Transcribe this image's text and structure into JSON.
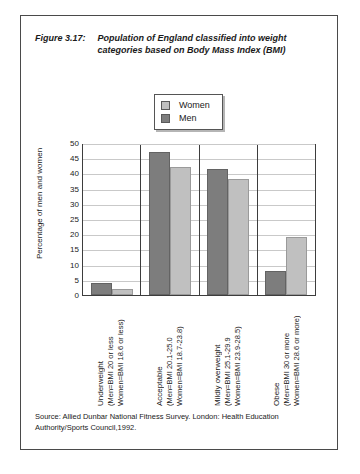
{
  "figure": {
    "number": "Figure 3.17:",
    "title_line1": "Population of England classified into weight",
    "title_line2": "categories based on Body Mass Index (BMI)"
  },
  "legend": {
    "items": [
      {
        "label": "Women",
        "color": "#c0c0c0",
        "swatch_name": "legend-swatch-women"
      },
      {
        "label": "Men",
        "color": "#7d7d7d",
        "swatch_name": "legend-swatch-men"
      }
    ]
  },
  "source": {
    "line1": "Source: Allied Dunbar National Fitness Survey. London: Health Education",
    "line2": "Authority/Sports Council,1992."
  },
  "chart_data": {
    "type": "bar",
    "title": "Population of England classified into weight categories based on Body Mass Index (BMI)",
    "xlabel": "",
    "ylabel": "Percentage of men and women",
    "ylim": [
      0,
      50
    ],
    "yticks": [
      0,
      5,
      10,
      15,
      20,
      25,
      30,
      35,
      40,
      45,
      50
    ],
    "ytick_labels": [
      "0",
      "5",
      "10",
      "15",
      "20",
      "25",
      "30",
      "35",
      "40",
      "45",
      "50"
    ],
    "grid": true,
    "legend_position": "top-center",
    "bar_order": [
      "Men",
      "Women"
    ],
    "categories": [
      "Underweight\n(Men=BMI 20 or less\nWomen=BMI 18.6 or less)",
      "Acceptable\n(Men=BMI 20.1-25.0\nWomen=BMI 18.7-23.8)",
      "Mildly overweight\n(Men=BMI 25.1-29.9\nWomen=BMI 23.9-28.5)",
      "Obese\n(Men=BMI 30 or more\nWomen=BMI 28.6 or more)"
    ],
    "category_details": [
      {
        "name": "Underweight",
        "men_range": "(Men=BMI 20 or less",
        "women_range": "Women=BMI 18.6 or less)"
      },
      {
        "name": "Acceptable",
        "men_range": "(Men=BMI 20.1-25.0",
        "women_range": "Women=BMI 18.7-23.8)"
      },
      {
        "name": "Mildly overweight",
        "men_range": "(Men=BMI 25.1-29.9",
        "women_range": "Women=BMI 23.9-28.5)"
      },
      {
        "name": "Obese",
        "men_range": "(Men=BMI 30 or more",
        "women_range": "Women=BMI 28.6 or more)"
      }
    ],
    "series": [
      {
        "name": "Men",
        "color": "#7d7d7d",
        "values": [
          4,
          47,
          41.5,
          8
        ]
      },
      {
        "name": "Women",
        "color": "#c0c0c0",
        "values": [
          2,
          42,
          38,
          19
        ]
      }
    ]
  }
}
